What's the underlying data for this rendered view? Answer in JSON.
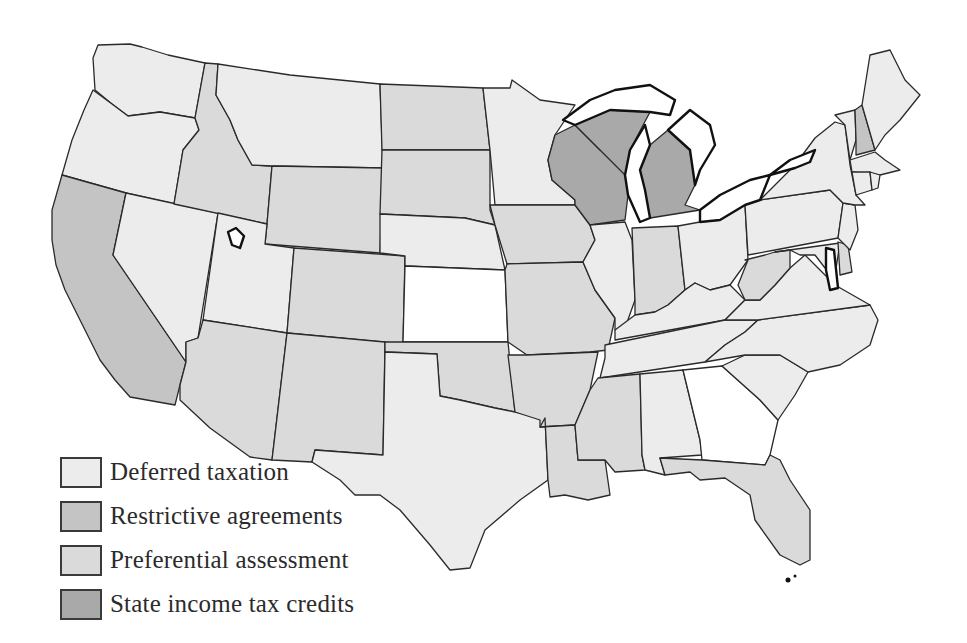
{
  "map": {
    "title": "",
    "region": "Contiguous United States",
    "colors": {
      "deferred": "#ececec",
      "restrictive": "#c4c4c4",
      "preferential": "#dadada",
      "income_tax": "#a9a9a9",
      "none": "#ffffff",
      "border": "#2a2a2a"
    },
    "states": {
      "WA": "deferred",
      "OR": "deferred",
      "CA": "restrictive",
      "NV": "deferred",
      "ID": "preferential",
      "MT": "deferred",
      "WY": "preferential",
      "UT": "deferred",
      "AZ": "preferential",
      "CO": "preferential",
      "NM": "preferential",
      "ND": "preferential",
      "SD": "preferential",
      "NE": "deferred",
      "KS": "none",
      "OK": "preferential",
      "TX": "deferred",
      "MN": "deferred",
      "IA": "preferential",
      "MO": "preferential",
      "AR": "preferential",
      "LA": "preferential",
      "WI": "income_tax",
      "MI": "income_tax",
      "IL": "deferred",
      "IN": "preferential",
      "OH": "deferred",
      "KY": "deferred",
      "TN": "deferred",
      "MS": "preferential",
      "AL": "deferred",
      "GA": "none",
      "FL": "preferential",
      "SC": "deferred",
      "NC": "deferred",
      "VA": "deferred",
      "WV": "preferential",
      "MD": "deferred",
      "DE": "preferential",
      "PA": "deferred",
      "NJ": "deferred",
      "NY": "deferred",
      "VT": "deferred",
      "NH": "restrictive",
      "ME": "deferred",
      "MA": "deferred",
      "CT": "deferred",
      "RI": "deferred"
    }
  },
  "legend": {
    "items": [
      {
        "key": "deferred",
        "label": "Deferred taxation"
      },
      {
        "key": "restrictive",
        "label": "Restrictive agreements"
      },
      {
        "key": "preferential",
        "label": "Preferential assessment"
      },
      {
        "key": "income_tax",
        "label": "State income tax credits"
      }
    ]
  }
}
